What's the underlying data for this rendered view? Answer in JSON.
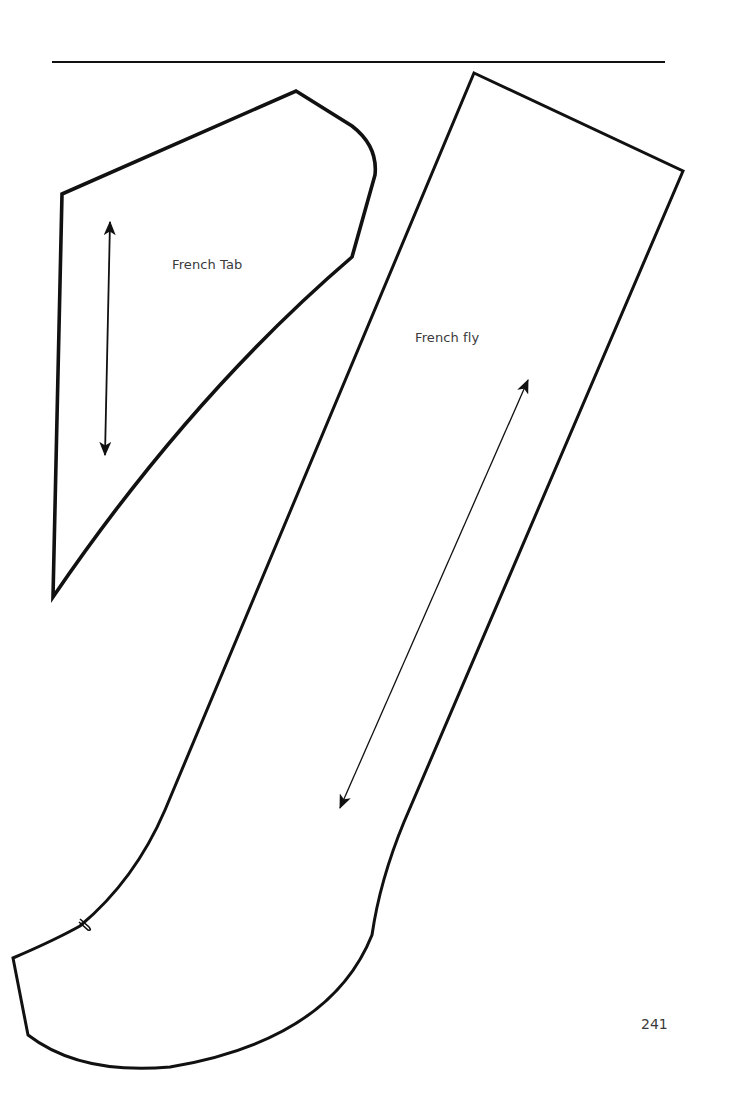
{
  "page": {
    "number": "241",
    "background_color": "#ffffff",
    "line_color": "#111111",
    "text_color": "#3a3a3a"
  },
  "pieces": [
    {
      "id": "french-tab",
      "label": "French Tab",
      "grainline": "vertical double-headed arrow"
    },
    {
      "id": "french-fly",
      "label": "French fly",
      "grainline": "diagonal double-headed arrow",
      "notch": "single notch on lower left curve"
    }
  ]
}
